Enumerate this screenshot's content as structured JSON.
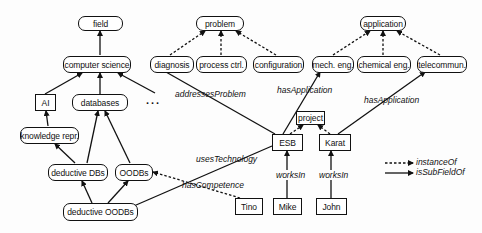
{
  "diagram": {
    "class_nodes": {
      "field": "field",
      "computer_science": "computer science",
      "ai": "AI",
      "databases": "databases",
      "knowledge_repr": "knowledge repr.",
      "deductive_dbs": "deductive DBs",
      "oodbs": "OODBs",
      "deductive_oodbs": "deductive OODBs",
      "problem": "problem",
      "diagnosis": "diagnosis",
      "process_ctrl": "process ctrl.",
      "configuration": "configuration",
      "application": "application",
      "mech_eng": "mech. eng.",
      "chemical_eng": "chemical eng.",
      "telecommun": "telecommun."
    },
    "instance_nodes": {
      "project": "project",
      "esb": "ESB",
      "karat": "Karat",
      "tino": "Tino",
      "mike": "Mike",
      "john": "John"
    },
    "ellipsis": "...",
    "edge_labels": {
      "addresses_problem": "addressesProblem",
      "has_application_1": "hasApplication",
      "has_application_2": "hasApplication",
      "uses_technology": "usesTechnology",
      "has_competence": "hasCompetence",
      "works_in_1": "worksIn",
      "works_in_2": "worksIn"
    },
    "legend": {
      "instance_of": "instanceOf",
      "is_sub_field_of": "isSubFieldOf"
    },
    "colors": {
      "stroke": "#111111",
      "background": "#ffffff"
    }
  }
}
